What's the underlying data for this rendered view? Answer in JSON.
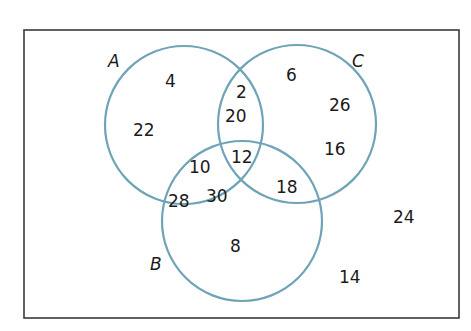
{
  "diagram": {
    "type": "venn",
    "colors": {
      "circle_stroke": "#6fa3b8",
      "frame_stroke": "#3a3a3a",
      "text": "#1a1a1a"
    },
    "sets": {
      "A": {
        "label": "A"
      },
      "B": {
        "label": "B"
      },
      "C": {
        "label": "C"
      }
    },
    "regions": {
      "A_only_top": "4",
      "A_only_left": "22",
      "A_C_only_top": "2",
      "A_C_only": "20",
      "A_B_only_upper": "10",
      "A_B_only_left": "28",
      "A_B_only_lower": "30",
      "A_B_C": "12",
      "C_only_top": "6",
      "C_only_mid": "26",
      "C_only_lower": "16",
      "B_C_only": "18",
      "B_only": "8",
      "outside_right": "24",
      "outside_bottom": "14"
    }
  }
}
